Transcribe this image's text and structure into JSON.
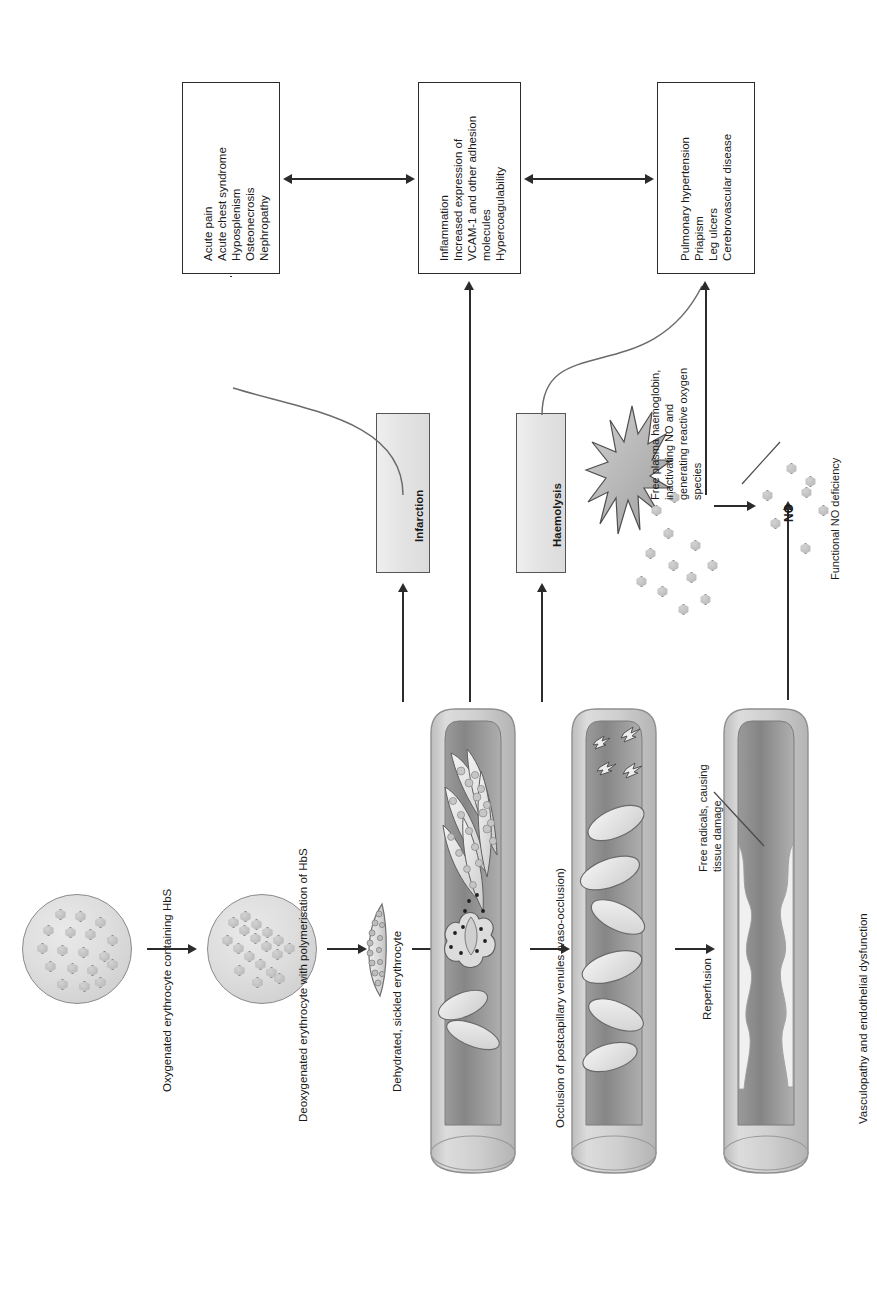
{
  "figure": {
    "domain": "diagram",
    "topic": "Pathophysiology of sickle cell disease",
    "orientation": "text rotated 90 degrees counter-clockwise"
  },
  "outcome_boxes": [
    {
      "id": "clinical-vaso-occlusive",
      "lines": [
        "Acute pain",
        "Acute chest syndrome",
        "Hyposplenism",
        "Osteonecrosis",
        "Nephropathy"
      ]
    },
    {
      "id": "inflammation-adhesion",
      "lines": [
        "Inflammation",
        "Increased expression of",
        "VCAM-1 and other adhesion",
        "molecules",
        "Hypercoagulability"
      ]
    },
    {
      "id": "haemolysis-endothelial",
      "lines": [
        "Pulmonary hypertension",
        "Priapism",
        "Leg ulcers",
        "Cerebrovascular disease"
      ]
    }
  ],
  "process_boxes": [
    {
      "id": "infarction",
      "label": "Infarction"
    },
    {
      "id": "haemolysis",
      "label": "Haemolysis"
    }
  ],
  "stage_labels": [
    {
      "id": "oxygenated-erythrocyte",
      "text": "Oxygenated erythrocyte containing HbS"
    },
    {
      "id": "deoxygenated-erythrocyte",
      "text": "Deoxygenated erythrocyte with polymerisation of HbS"
    },
    {
      "id": "sickled-erythrocyte",
      "text": "Dehydrated, sickled erythrocyte"
    },
    {
      "id": "vaso-occlusion",
      "text": "Occlusion of postcapillary venules (vaso-occlusion)"
    },
    {
      "id": "reperfusion",
      "text": "Reperfusion"
    },
    {
      "id": "vasculopathy",
      "text": "Vasculopathy and endothelial dysfunction"
    }
  ],
  "annotations": [
    {
      "id": "free-plasma-haemoglobin",
      "lines": [
        "Free plasma haemoglobin,",
        "inactivating NO and",
        "generating reactive oxygen",
        "species"
      ]
    },
    {
      "id": "free-radicals",
      "lines": [
        "Free radicals, causing",
        "tissue damage"
      ]
    },
    {
      "id": "no-label",
      "text": "NO"
    },
    {
      "id": "functional-no-deficiency",
      "text": "Functional NO deficiency"
    }
  ],
  "colors": {
    "stroke": "#2b2b2b",
    "box_fill": "#ffffff",
    "grey_box_fill": "#e6e6e6",
    "vessel_wall": "#cfcfcf",
    "vessel_lumen_dark": "#8d8d8d",
    "vessel_lumen_light": "#b8b8b8",
    "cell_fill": "#e2e2e2"
  }
}
